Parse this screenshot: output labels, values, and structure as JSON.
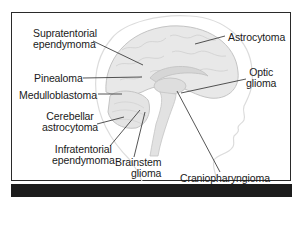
{
  "diagram": {
    "type": "labeled anatomical illustration",
    "colors": {
      "frame": "#2a2a2a",
      "bottom_bar": "#1c1c1c",
      "brain_fill": "#e6e6e6",
      "brain_outline": "#c8c8c8",
      "leader_line": "#2a2a2a",
      "text": "#1a1a1a"
    },
    "labels": {
      "supratentorial": [
        "Supratentorial",
        "ependymoma"
      ],
      "pinealoma": "Pinealoma",
      "medulloblastoma": "Medulloblastoma",
      "cerebellar": [
        "Cerebellar",
        "astrocytoma"
      ],
      "infratentorial": [
        "Infratentorial",
        "ependymoma"
      ],
      "brainstem": [
        "Brainstem",
        "glioma"
      ],
      "astrocytoma": "Astrocytoma",
      "optic": [
        "Optic",
        "glioma"
      ],
      "craniopharyngioma": "Craniopharyngioma"
    }
  }
}
